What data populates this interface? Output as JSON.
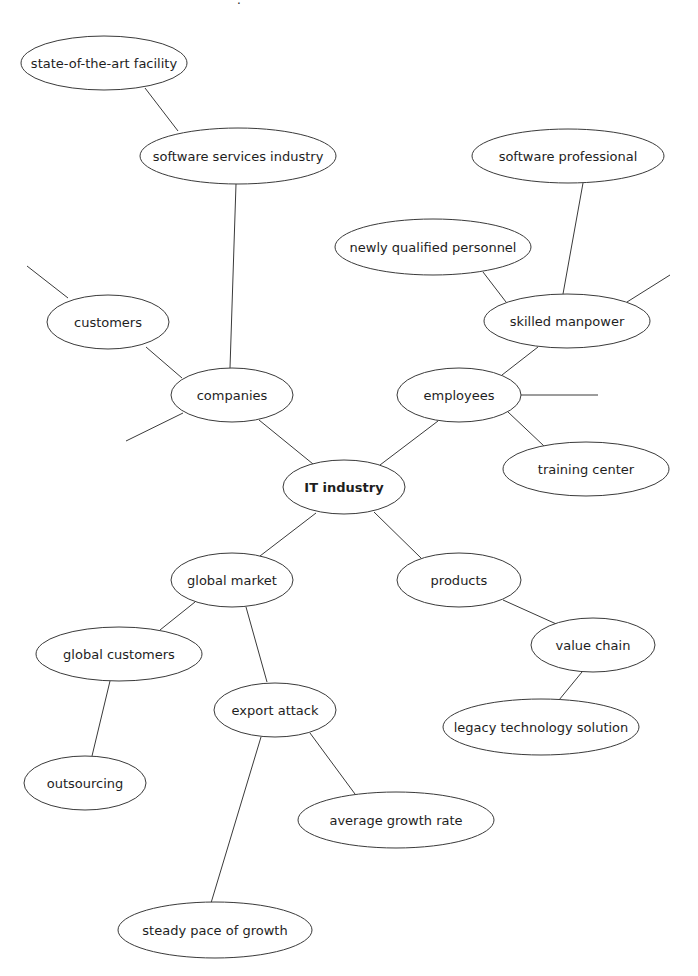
{
  "diagram": {
    "type": "mind-map",
    "central_node": "it-industry",
    "colors": {
      "stroke": "#3a3a3a",
      "text": "#1e1e1e",
      "background": "#ffffff"
    },
    "nodes": [
      {
        "id": "state-of-the-art-facility",
        "label": "state-of-the-art facility",
        "cx": 104,
        "cy": 63,
        "rx": 83,
        "ry": 27
      },
      {
        "id": "software-services-industry",
        "label": "software services industry",
        "cx": 238,
        "cy": 156,
        "rx": 98,
        "ry": 28
      },
      {
        "id": "software-professional",
        "label": "software professional",
        "cx": 568,
        "cy": 156,
        "rx": 96,
        "ry": 27
      },
      {
        "id": "newly-qualified-personnel",
        "label": "newly qualified personnel",
        "cx": 433,
        "cy": 247,
        "rx": 98,
        "ry": 28
      },
      {
        "id": "skilled-manpower",
        "label": "skilled manpower",
        "cx": 567,
        "cy": 321,
        "rx": 83,
        "ry": 27
      },
      {
        "id": "customers",
        "label": "customers",
        "cx": 108,
        "cy": 322,
        "rx": 61,
        "ry": 27
      },
      {
        "id": "companies",
        "label": "companies",
        "cx": 232,
        "cy": 395,
        "rx": 61,
        "ry": 27
      },
      {
        "id": "employees",
        "label": "employees",
        "cx": 459,
        "cy": 395,
        "rx": 62,
        "ry": 27
      },
      {
        "id": "training-center",
        "label": "training center",
        "cx": 586,
        "cy": 469,
        "rx": 83,
        "ry": 27
      },
      {
        "id": "it-industry",
        "label": "IT industry",
        "cx": 344,
        "cy": 487,
        "rx": 61,
        "ry": 27,
        "central": true
      },
      {
        "id": "global-market",
        "label": "global market",
        "cx": 232,
        "cy": 580,
        "rx": 61,
        "ry": 27
      },
      {
        "id": "products",
        "label": "products",
        "cx": 459,
        "cy": 580,
        "rx": 62,
        "ry": 27
      },
      {
        "id": "value-chain",
        "label": "value chain",
        "cx": 593,
        "cy": 645,
        "rx": 62,
        "ry": 27
      },
      {
        "id": "global-customers",
        "label": "global customers",
        "cx": 119,
        "cy": 654,
        "rx": 83,
        "ry": 27
      },
      {
        "id": "export-attack",
        "label": "export attack",
        "cx": 275,
        "cy": 710,
        "rx": 61,
        "ry": 27
      },
      {
        "id": "legacy-technology-solution",
        "label": "legacy technology solution",
        "cx": 541,
        "cy": 727,
        "rx": 98,
        "ry": 28
      },
      {
        "id": "outsourcing",
        "label": "outsourcing",
        "cx": 85,
        "cy": 783,
        "rx": 61,
        "ry": 27
      },
      {
        "id": "average-growth-rate",
        "label": "average growth rate",
        "cx": 396,
        "cy": 820,
        "rx": 98,
        "ry": 28
      },
      {
        "id": "steady-pace-of-growth",
        "label": "steady pace of growth",
        "cx": 215,
        "cy": 930,
        "rx": 97,
        "ry": 28
      }
    ],
    "edges": [
      {
        "from": "state-of-the-art-facility",
        "to": "software-services-industry",
        "x1": 145,
        "y1": 88,
        "x2": 178,
        "y2": 131
      },
      {
        "from": "software-services-industry",
        "to": "companies",
        "x1": 236,
        "y1": 184,
        "x2": 230,
        "y2": 368
      },
      {
        "from": "customers",
        "to": "companies",
        "x1": 146,
        "y1": 347,
        "x2": 182,
        "y2": 378
      },
      {
        "from": "companies",
        "to": "it-industry",
        "x1": 259,
        "y1": 420,
        "x2": 313,
        "y2": 464
      },
      {
        "from": "employees",
        "to": "it-industry",
        "x1": 438,
        "y1": 421,
        "x2": 380,
        "y2": 465
      },
      {
        "from": "software-professional",
        "to": "skilled-manpower",
        "x1": 583,
        "y1": 183,
        "x2": 563,
        "y2": 294
      },
      {
        "from": "newly-qualified-personnel",
        "to": "skilled-manpower",
        "x1": 483,
        "y1": 272,
        "x2": 506,
        "y2": 302
      },
      {
        "from": "skilled-manpower",
        "to": "employees",
        "x1": 538,
        "y1": 347,
        "x2": 502,
        "y2": 375
      },
      {
        "from": "employees",
        "to": "training-center",
        "x1": 508,
        "y1": 412,
        "x2": 544,
        "y2": 446
      },
      {
        "from": "it-industry",
        "to": "global-market",
        "x1": 316,
        "y1": 513,
        "x2": 260,
        "y2": 556
      },
      {
        "from": "it-industry",
        "to": "products",
        "x1": 374,
        "y1": 512,
        "x2": 421,
        "y2": 558
      },
      {
        "from": "products",
        "to": "value-chain",
        "x1": 503,
        "y1": 600,
        "x2": 563,
        "y2": 627
      },
      {
        "from": "value-chain",
        "to": "legacy-technology-solution",
        "x1": 582,
        "y1": 672,
        "x2": 559,
        "y2": 700
      },
      {
        "from": "global-market",
        "to": "global-customers",
        "x1": 195,
        "y1": 602,
        "x2": 160,
        "y2": 630
      },
      {
        "from": "global-market",
        "to": "export-attack",
        "x1": 246,
        "y1": 607,
        "x2": 267,
        "y2": 682
      },
      {
        "from": "global-customers",
        "to": "outsourcing",
        "x1": 110,
        "y1": 681,
        "x2": 92,
        "y2": 756
      },
      {
        "from": "export-attack",
        "to": "average-growth-rate",
        "x1": 310,
        "y1": 733,
        "x2": 355,
        "y2": 794
      },
      {
        "from": "export-attack",
        "to": "steady-pace-of-growth",
        "x1": 261,
        "y1": 737,
        "x2": 211,
        "y2": 903
      }
    ],
    "dangling_edges": [
      {
        "from": "customers",
        "x1": 68,
        "y1": 298,
        "x2": 27,
        "y2": 266
      },
      {
        "from": "companies",
        "x1": 183,
        "y1": 413,
        "x2": 126,
        "y2": 441
      },
      {
        "from": "skilled-manpower",
        "x1": 627,
        "y1": 302,
        "x2": 670,
        "y2": 275
      },
      {
        "from": "employees",
        "x1": 521,
        "y1": 395,
        "x2": 598,
        "y2": 395
      }
    ],
    "top_fragment": {
      "label": "·",
      "x": 237,
      "y": 4
    }
  }
}
